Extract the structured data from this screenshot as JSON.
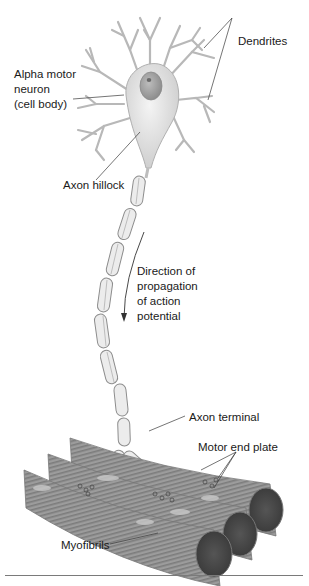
{
  "diagram": {
    "labels": {
      "dendrites": "Dendrites",
      "cell_body_line1": "Alpha motor",
      "cell_body_line2": "neuron",
      "cell_body_line3": "(cell body)",
      "axon_hillock": "Axon hillock",
      "direction_line1": "Direction of",
      "direction_line2": "propagation",
      "direction_line3": "of action",
      "direction_line4": "potential",
      "axon_terminal": "Axon terminal",
      "motor_end_plate": "Motor end plate",
      "myofibrils": "Myofibrils"
    },
    "colors": {
      "soma_fill": "#e4e4e4",
      "nucleus_fill": "#a8a8a8",
      "myelin_fill": "#ececec",
      "muscle_fill": "#9a9a9a",
      "muscle_stripe": "#7a7a7a",
      "muscle_end": "#4a4a4a",
      "line": "#6e6e6e",
      "text": "#1a1a1a"
    }
  }
}
